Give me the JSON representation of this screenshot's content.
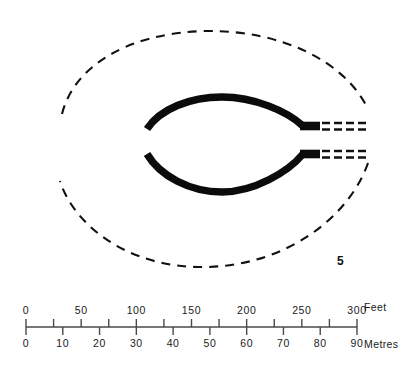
{
  "figure": {
    "number": "5",
    "background_color": "#ffffff",
    "ink_color": "#111111"
  },
  "plan": {
    "solid_feature_name": "bank-arcs",
    "dashed_feature_name": "outer-enclosure-ditch",
    "extension_name": "dashed-rail-extensions",
    "solid_color": "#0b0b0b",
    "dashed_color": "#111111"
  },
  "scalebar": {
    "axis_color": "#4a4a4a",
    "feet": {
      "unit_label": "Feet",
      "ticks": [
        {
          "label": "0",
          "value": 0
        },
        {
          "label": "",
          "value": 25
        },
        {
          "label": "50",
          "value": 50
        },
        {
          "label": "",
          "value": 75
        },
        {
          "label": "100",
          "value": 100
        },
        {
          "label": "",
          "value": 125
        },
        {
          "label": "150",
          "value": 150
        },
        {
          "label": "",
          "value": 175
        },
        {
          "label": "200",
          "value": 200
        },
        {
          "label": "",
          "value": 225
        },
        {
          "label": "250",
          "value": 250
        },
        {
          "label": "",
          "value": 275
        },
        {
          "label": "300",
          "value": 300
        }
      ],
      "min": 0,
      "max": 300
    },
    "metres": {
      "unit_label": "Metres",
      "ticks": [
        {
          "label": "0",
          "value": 0
        },
        {
          "label": "10",
          "value": 10
        },
        {
          "label": "20",
          "value": 20
        },
        {
          "label": "30",
          "value": 30
        },
        {
          "label": "40",
          "value": 40
        },
        {
          "label": "50",
          "value": 50
        },
        {
          "label": "60",
          "value": 60
        },
        {
          "label": "70",
          "value": 70
        },
        {
          "label": "80",
          "value": 80
        },
        {
          "label": "90",
          "value": 90
        }
      ],
      "min": 0,
      "max": 90
    }
  }
}
